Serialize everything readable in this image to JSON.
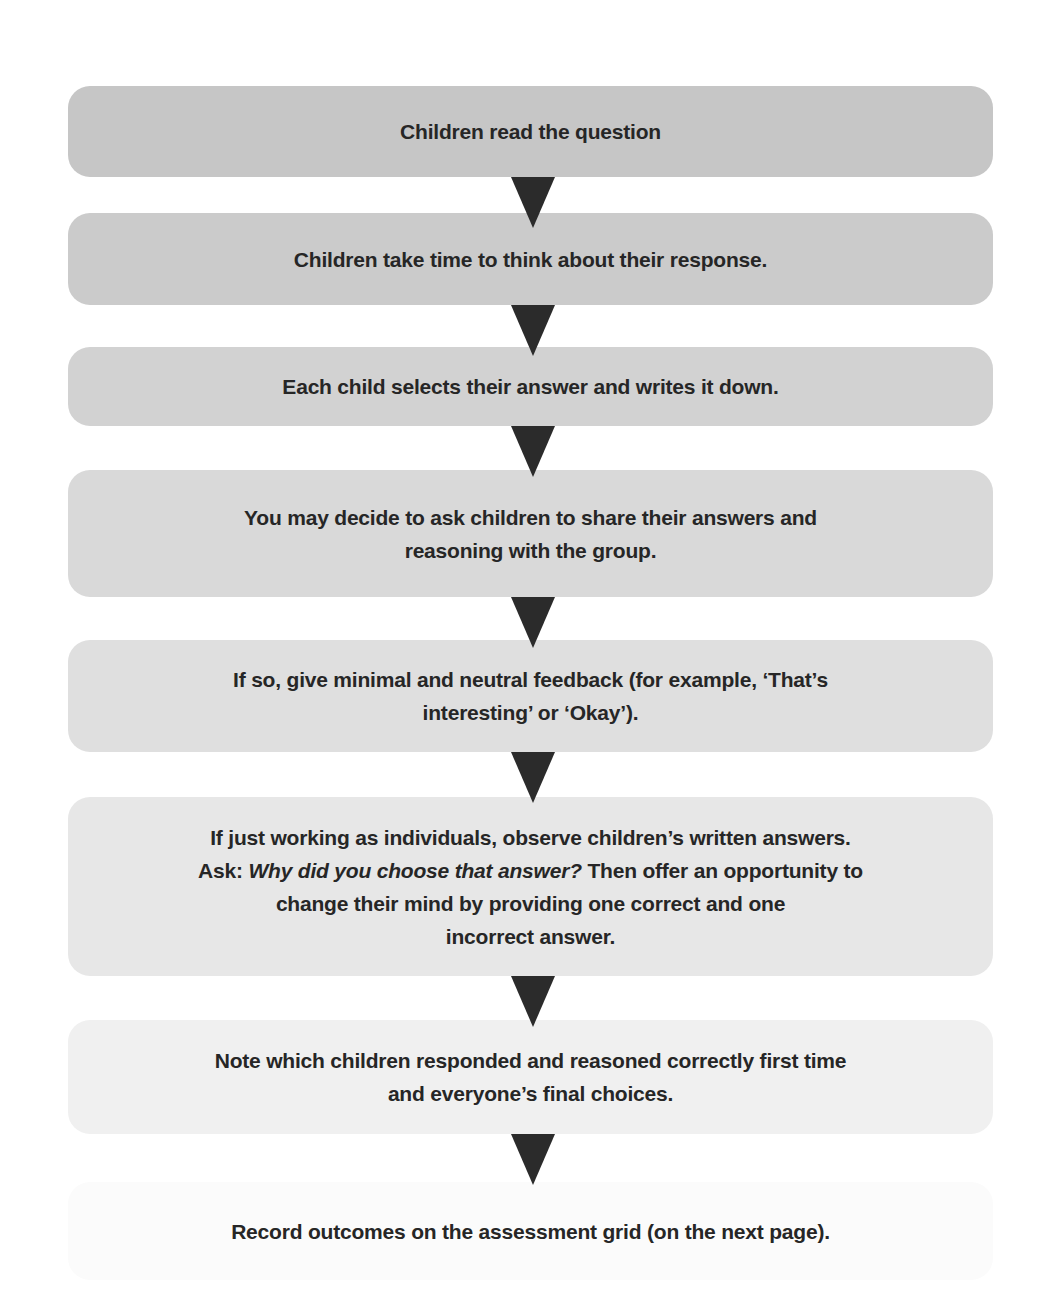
{
  "flowchart": {
    "steps": [
      {
        "text": "Children read the question",
        "top": 86,
        "height": 91,
        "color": "#c6c6c6"
      },
      {
        "text": "Children take time to think about their response.",
        "top": 213,
        "height": 92,
        "color": "#cbcbcb"
      },
      {
        "text": "Each child selects their answer and writes it down.",
        "top": 347,
        "height": 79,
        "color": "#d2d2d2"
      },
      {
        "text": "You may decide to ask children to share their answers and\nreasoning with the group.",
        "top": 470,
        "height": 127,
        "color": "#d9d9d9"
      },
      {
        "text": "If so, give minimal and neutral feedback (for example, ‘That’s\ninteresting’ or ‘Okay’).",
        "top": 640,
        "height": 112,
        "color": "#dfdfdf"
      },
      {
        "text_line1": "If just working as individuals, observe children’s written answers.",
        "text_ask_prefix": "Ask: ",
        "text_ask_italic": "Why did you choose that answer?",
        "text_ask_suffix": " Then offer an opportunity to",
        "text_line3": "change their mind by providing one correct and one",
        "text_line4": "incorrect answer.",
        "top": 797,
        "height": 179,
        "color": "#e7e7e7"
      },
      {
        "text": "Note which children responded and reasoned correctly first time\nand everyone’s final choices.",
        "top": 1020,
        "height": 114,
        "color": "#f0f0f0"
      },
      {
        "text": "Record outcomes on the assessment grid (on the next page).",
        "top": 1182,
        "height": 98,
        "color": "#fbfbfb"
      }
    ],
    "arrows": [
      {
        "top": 177
      },
      {
        "top": 305
      },
      {
        "top": 426
      },
      {
        "top": 597
      },
      {
        "top": 752
      },
      {
        "top": 976
      },
      {
        "top": 1134
      }
    ],
    "arrow_color": "#2b2b2b",
    "text_color": "#262626"
  }
}
